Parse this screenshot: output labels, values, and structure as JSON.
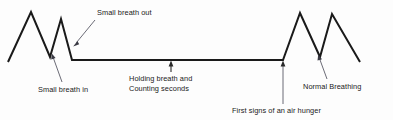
{
  "figure": {
    "background_color": "#fdfdfd",
    "line_color": "#1a1a1a",
    "leader_color": "#5a5a66",
    "text_color": "#1a1a1a"
  },
  "labels": {
    "small_breath_out": "Small breath out",
    "small_breath_in": "Small breath in",
    "holding_breath_line1": "Holding breath and",
    "holding_breath_line2": "Counting seconds",
    "first_signs": "First signs of an air hunger",
    "normal_breathing": "Normal Breathing"
  },
  "chart_data": {
    "type": "line",
    "xlabel": "",
    "ylabel": "",
    "grid": false,
    "legend": null,
    "xlim": [
      0,
      393
    ],
    "ylim": [
      120,
      0
    ],
    "series": [
      {
        "name": "breathing-waveform",
        "points": [
          [
            8,
            62
          ],
          [
            31,
            12
          ],
          [
            50,
            57
          ],
          [
            61,
            19
          ],
          [
            72,
            60
          ],
          [
            283,
            60
          ],
          [
            300,
            13
          ],
          [
            320,
            57
          ],
          [
            332,
            14
          ],
          [
            360,
            62
          ]
        ]
      }
    ],
    "annotations": [
      {
        "name": "small-breath-out",
        "text": "Small breath out",
        "text_x": 97,
        "text_y": 10,
        "leader": [
          [
            95,
            20
          ],
          [
            74,
            45
          ]
        ],
        "arrow": "down-left"
      },
      {
        "name": "small-breath-in",
        "text": "Small breath in",
        "text_x": 38,
        "text_y": 84,
        "leader": [
          [
            62,
            82
          ],
          [
            52,
            54
          ]
        ],
        "arrow": "up-left"
      },
      {
        "name": "holding-breath-and-counting-seconds",
        "text": "Holding breath and\nCounting seconds",
        "text_x": 130,
        "text_y": 73,
        "leader": [
          [
            171,
            71
          ],
          [
            171,
            61
          ]
        ],
        "arrow": "up"
      },
      {
        "name": "first-signs-of-an-air-hunger",
        "text": "First signs of an air hunger",
        "text_x": 232,
        "text_y": 106,
        "leader": [
          [
            283,
            104
          ],
          [
            283,
            61
          ]
        ],
        "arrow": "up"
      },
      {
        "name": "normal-breathing",
        "text": "Normal Breathing",
        "text_x": 303,
        "text_y": 81,
        "leader": [
          [
            327,
            79
          ],
          [
            318,
            55
          ]
        ],
        "arrow": "up-left"
      }
    ]
  }
}
